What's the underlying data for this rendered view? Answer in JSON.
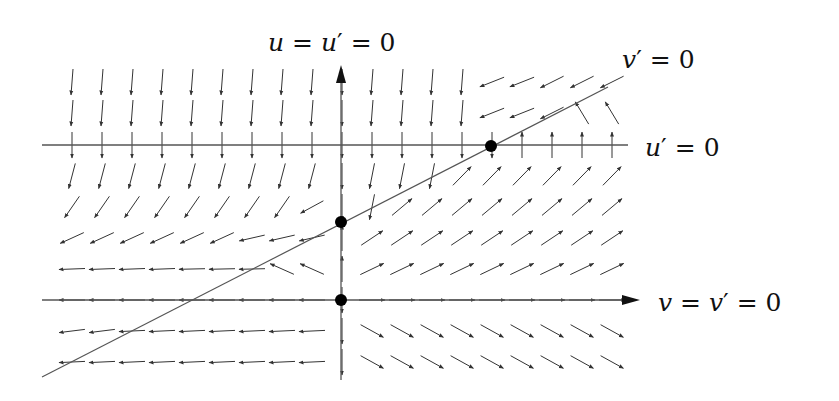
{
  "diagram": {
    "type": "phase-portrait",
    "labels": {
      "vertical_axis": "u = u′ = 0",
      "v_nullcline": "v′ = 0",
      "u_nullcline": "u′ = 0",
      "horizontal_axis": "v = v′ = 0"
    },
    "axes": {
      "vertical": {
        "x": 341,
        "y_top": 65,
        "y_bottom": 380
      },
      "horizontal": {
        "y": 300,
        "x_left": 42,
        "x_right": 640
      }
    },
    "nullclines": {
      "u_prime_zero": {
        "y": 145,
        "x_left": 42,
        "x_right": 628
      },
      "v_prime_zero": {
        "x1": 42,
        "y1": 377,
        "x2": 608,
        "y2": 87
      }
    },
    "equilibria": [
      {
        "x": 341,
        "y": 300
      },
      {
        "x": 341,
        "y": 222
      },
      {
        "x": 491,
        "y": 146
      }
    ],
    "colors": {
      "line": "#555555",
      "arrow": "#333333",
      "dot": "#000000",
      "text": "#111111"
    }
  }
}
